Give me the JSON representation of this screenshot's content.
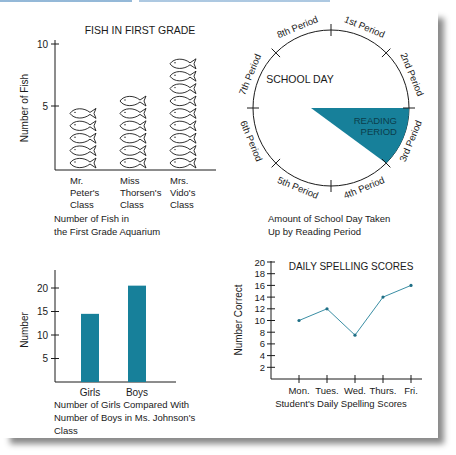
{
  "colors": {
    "accent": "#17809a",
    "ink": "#1a1a1a",
    "shadow": "#8a8a8a"
  },
  "chart_data": [
    {
      "type": "pictograph",
      "title": "FISH IN FIRST GRADE",
      "ylabel": "Number of Fish",
      "xlabel": "",
      "caption": "Number of Fish in the First Grade Aquarium",
      "caption_lines": [
        "Number of Fish in",
        "the First Grade Aquarium"
      ],
      "categories": [
        "Mr. Peter's Class",
        "Miss Thorsen's Class",
        "Mrs. Vido's Class"
      ],
      "category_lines": [
        [
          "Mr.",
          "Peter's",
          "Class"
        ],
        [
          "Miss",
          "Thorsen's",
          "Class"
        ],
        [
          "Mrs.",
          "Vido's",
          "Class"
        ]
      ],
      "values": [
        5,
        6,
        9
      ],
      "yticks": [
        5,
        10
      ],
      "ylim": [
        0,
        10
      ],
      "icon": "fish-icon"
    },
    {
      "type": "pie",
      "title": "SCHOOL DAY",
      "caption": "Amount of School Day Taken Up by Reading Period",
      "caption_lines": [
        "Amount of School Day Taken",
        "Up by Reading Period"
      ],
      "slices": [
        {
          "label": "1st Period",
          "value": 1
        },
        {
          "label": "2nd Period",
          "value": 1
        },
        {
          "label": "3rd Period",
          "value": 1,
          "highlight": true,
          "inner_label": "READING PERIOD"
        },
        {
          "label": "4th Period",
          "value": 1
        },
        {
          "label": "5th Period",
          "value": 1
        },
        {
          "label": "6th Period",
          "value": 1
        },
        {
          "label": "7th Period",
          "value": 1
        },
        {
          "label": "8th Period",
          "value": 1
        }
      ],
      "highlight_label_lines": [
        "READING",
        "PERIOD"
      ]
    },
    {
      "type": "bar",
      "title": "",
      "ylabel": "Number",
      "caption": "Number of Girls Compared With Number of Boys in Ms. Johnson's Class",
      "caption_lines": [
        "Number of Girls Compared With",
        "Number of Boys in Ms. Johnson's",
        "Class"
      ],
      "categories": [
        "Girls",
        "Boys"
      ],
      "values": [
        14.5,
        20.5
      ],
      "yticks": [
        5,
        10,
        15,
        20
      ],
      "ylim": [
        0,
        24
      ],
      "grid": false
    },
    {
      "type": "line",
      "title": "DAILY SPELLING SCORES",
      "ylabel": "Number Correct",
      "caption": "Student's Daily Spelling Scores",
      "categories": [
        "Mon.",
        "Tues.",
        "Wed.",
        "Thurs.",
        "Fri."
      ],
      "values": [
        10,
        12,
        7.5,
        14,
        16
      ],
      "yticks": [
        2,
        4,
        6,
        8,
        10,
        12,
        14,
        16,
        18,
        20
      ],
      "ylim": [
        0,
        20
      ],
      "grid": false
    }
  ]
}
